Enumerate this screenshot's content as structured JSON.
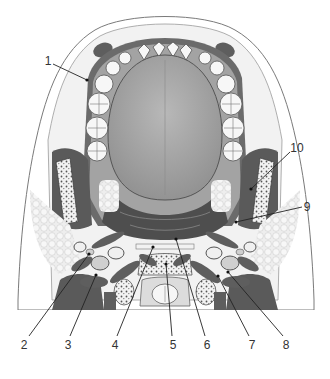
{
  "figure": {
    "colors": {
      "skin": "#ffffff",
      "soft_tissue": "#e6e6e6",
      "muscle": "#5e5e5e",
      "tongue": "#a9a9a9",
      "tooth": "#f7f7f7",
      "bone_marrow": "#cfcfcf",
      "fat": "#ececec",
      "outline": "#444444"
    }
  },
  "labels": [
    {
      "id": "1",
      "text": "1",
      "x": 48,
      "y": 61,
      "target": [
        87,
        80
      ]
    },
    {
      "id": "2",
      "text": "2",
      "x": 24,
      "y": 345,
      "target": [
        89,
        254
      ]
    },
    {
      "id": "3",
      "text": "3",
      "x": 68,
      "y": 345,
      "target": [
        96,
        275
      ]
    },
    {
      "id": "4",
      "text": "4",
      "x": 115,
      "y": 345,
      "target": [
        153,
        247
      ]
    },
    {
      "id": "5",
      "text": "5",
      "x": 173,
      "y": 345,
      "target": [
        166,
        264
      ]
    },
    {
      "id": "6",
      "text": "6",
      "x": 207,
      "y": 345,
      "target": [
        176,
        239
      ]
    },
    {
      "id": "7",
      "text": "7",
      "x": 252,
      "y": 345,
      "target": [
        218,
        276
      ]
    },
    {
      "id": "8",
      "text": "8",
      "x": 286,
      "y": 345,
      "target": [
        228,
        272
      ]
    },
    {
      "id": "9",
      "text": "9",
      "x": 307,
      "y": 207,
      "target": [
        236,
        222
      ]
    },
    {
      "id": "10",
      "text": "10",
      "x": 297,
      "y": 148,
      "target": [
        251,
        189
      ]
    }
  ]
}
